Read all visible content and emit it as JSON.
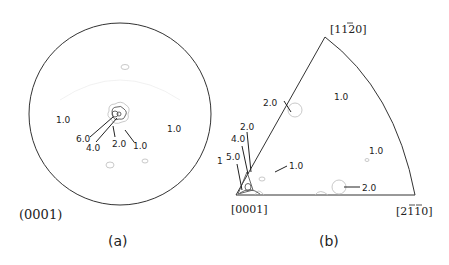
{
  "figure": {
    "panel_a": {
      "caption": "(a)",
      "plane_label": "(0001)",
      "type": "pole figure",
      "contour_labels": {
        "left": "1.0",
        "right": "1.0",
        "c6": "6.0",
        "c4": "4.0",
        "c2": "2.0",
        "c1": "1.0"
      }
    },
    "panel_b": {
      "caption": "(b)",
      "type": "inverse pole figure",
      "corner_labels": {
        "origin": "[0001]",
        "apex": "[11\u00032̅0]",
        "right": "[2̅1̅1̅10]"
      },
      "corner_parts": {
        "apex_prefix": "[11",
        "apex_bar": "2",
        "apex_suffix": "0]",
        "right_prefix": "[2",
        "right_bar1": "1",
        "right_bar2": "1",
        "right_suffix": "0]"
      },
      "contour_labels": {
        "edge_upper": "2.0",
        "center_top": "1.0",
        "right_mid": "1.0",
        "inner": "1.0",
        "bottom_right": "2.0",
        "left_2": "2.0",
        "left_4": "4.0",
        "left_5": "5.0",
        "left_1": "1"
      }
    }
  }
}
